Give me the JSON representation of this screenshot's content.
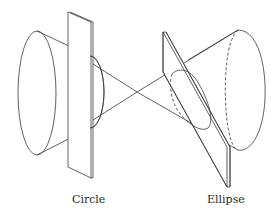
{
  "figure": {
    "left_section": {
      "label": "Circle",
      "plane": "vertical plane perpendicular to cone axis"
    },
    "right_section": {
      "label": "Ellipse",
      "plane": "tilted plane oblique to cone axis"
    },
    "colors": {
      "line": "#3a3a3a",
      "background": "#ffffff"
    }
  }
}
